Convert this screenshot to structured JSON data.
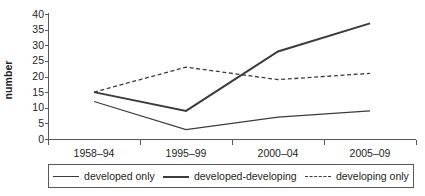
{
  "chart_data": {
    "type": "line",
    "title": "",
    "xlabel": "",
    "ylabel": "number",
    "categories": [
      "1958–94",
      "1995–99",
      "2000–04",
      "2005–09"
    ],
    "series": [
      {
        "name": "developed only",
        "values": [
          12,
          3,
          7,
          9
        ],
        "style": "solid-thin"
      },
      {
        "name": "developed-developing",
        "values": [
          15,
          9,
          28,
          37
        ],
        "style": "solid-thick"
      },
      {
        "name": "developing only",
        "values": [
          15,
          23,
          19,
          21
        ],
        "style": "dashed"
      }
    ],
    "ylim": [
      0,
      40
    ],
    "ytick_labels": [
      "0",
      "5",
      "10",
      "15",
      "20",
      "25",
      "30",
      "35",
      "40"
    ],
    "ytick_values": [
      0,
      5,
      10,
      15,
      20,
      25,
      30,
      35,
      40
    ],
    "grid": false,
    "legend_position": "bottom"
  },
  "axis": {
    "y_title": "number"
  },
  "legend": {
    "entries": [
      {
        "label": "developed only",
        "swatch": "line-thin-icon"
      },
      {
        "label": "developed-developing",
        "swatch": "line-thick-icon"
      },
      {
        "label": "developing only",
        "swatch": "line-dashed-icon"
      }
    ]
  }
}
